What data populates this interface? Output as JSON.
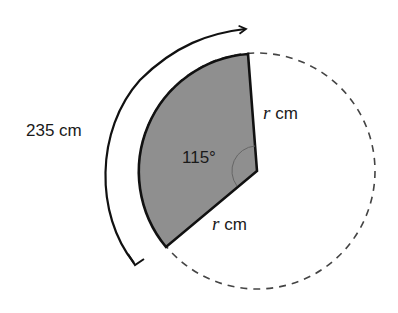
{
  "diagram": {
    "type": "circle-sector",
    "arc_length_label": "235 cm",
    "angle_label": "115°",
    "radius_upper": {
      "var": "r",
      "unit": " cm"
    },
    "radius_lower": {
      "var": "r",
      "unit": " cm"
    },
    "colors": {
      "sector_fill": "#8f8f8f",
      "stroke": "#111111",
      "dashed_circle": "#444444",
      "background": "#ffffff"
    }
  }
}
